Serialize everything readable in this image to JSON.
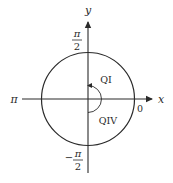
{
  "diagram": {
    "type": "unit-circle-angles",
    "axes": {
      "x_label": "x",
      "y_label": "y"
    },
    "angle_labels": {
      "top": {
        "num": "π",
        "den": "2"
      },
      "bottom": {
        "sign": "−",
        "num": "π",
        "den": "2"
      },
      "left": "π",
      "right": "0"
    },
    "quadrant_labels": {
      "upper": "QI",
      "lower": "QIV"
    },
    "colors": {
      "stroke": "#2a2a2a",
      "background": "#ffffff"
    }
  }
}
